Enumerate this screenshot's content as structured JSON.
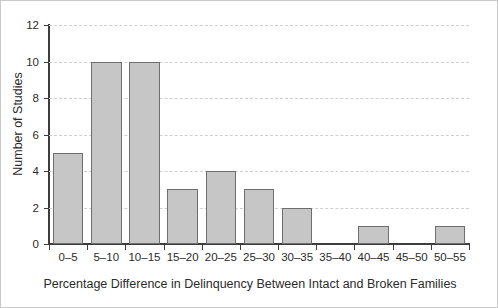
{
  "chart_data": {
    "type": "bar",
    "title": "",
    "subtitle": "",
    "xlabel": "Percentage Difference in Delinquency Between Intact and Broken Families",
    "ylabel": "Number of Studies",
    "categories": [
      "0–5",
      "5–10",
      "10–15",
      "15–20",
      "20–25",
      "25–30",
      "30–35",
      "35–40",
      "40–45",
      "45–50",
      "50–55"
    ],
    "values": [
      5,
      10,
      10,
      3,
      4,
      3,
      2,
      0,
      1,
      0,
      1
    ],
    "ylim": [
      0,
      12
    ],
    "ytick_values": [
      0,
      2,
      4,
      6,
      8,
      10,
      12
    ],
    "ytick_labels": [
      "0",
      "2",
      "4",
      "6",
      "8",
      "10",
      "12"
    ],
    "grid": "horizontal-dashed",
    "legend": "none",
    "legend_position": "none",
    "bar_fill_color": "#c6c6c6",
    "bar_edge_color": "#6e6e6e",
    "axis_color": "#3d3d3d",
    "gridline_color": "#cfcfcf",
    "text_color": "#2b2b2b",
    "background_color": "#ffffff",
    "frame_border_color": "#c9c9c9"
  }
}
